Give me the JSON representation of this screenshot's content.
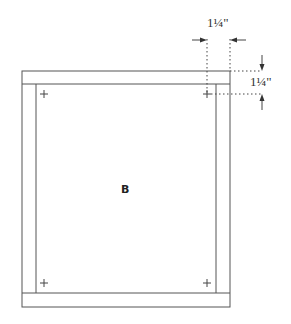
{
  "diagram": {
    "panel_label": "B",
    "dimensions": {
      "horizontal": "1¼\"",
      "vertical": "1¼\""
    },
    "colors": {
      "line": "#555555",
      "dotted": "#444444"
    },
    "frame": {
      "outer": {
        "x": 22,
        "y": 71,
        "w": 208,
        "h": 236
      },
      "rail_height": 13,
      "stile_width": 14
    },
    "marks": [
      {
        "x": 44,
        "y": 94
      },
      {
        "x": 207,
        "y": 94
      },
      {
        "x": 44,
        "y": 283
      },
      {
        "x": 207,
        "y": 283
      }
    ]
  }
}
